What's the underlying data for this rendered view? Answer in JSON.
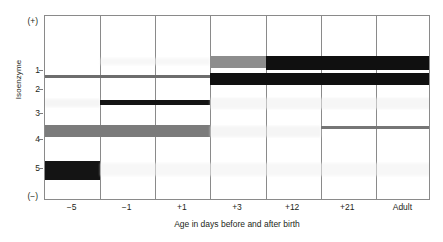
{
  "figure": {
    "axes": {
      "y_title": "Isoenzyme",
      "y_tick_labels": [
        "1",
        "2",
        "3",
        "4",
        "5"
      ],
      "y_polarity_top": "(+)",
      "y_polarity_bottom": "(−)",
      "x_title": "Age in days before and after birth",
      "x_tick_labels": [
        "−5",
        "−1",
        "+1",
        "+3",
        "+12",
        "+21",
        "Adult"
      ]
    },
    "colors": {
      "frame": "#8a8a8a",
      "text": "#231f20",
      "band_black": "#111111",
      "band_dark_gray": "#5f5f5f",
      "band_mid_gray": "#7b7b7b",
      "band_light_gray": "#b5b5b5",
      "band_faint": "#ececec",
      "background": "#ffffff"
    }
  },
  "chart_data": {
    "type": "heatmap",
    "title": "",
    "xlabel": "Age in days before and after birth",
    "ylabel": "Isoenzyme",
    "categories": [
      "−5",
      "−1",
      "+1",
      "+3",
      "+12",
      "+21",
      "Adult"
    ],
    "rows": [
      "1",
      "2",
      "3",
      "4",
      "5"
    ],
    "row_positions_pct": [
      30.0,
      41.5,
      55.0,
      69.5,
      85.5
    ],
    "grid": true,
    "legend": "none",
    "note": "Electrophoretic gel diagram: band darkness = relative isoenzyme abundance per age group",
    "series": [
      {
        "name": "Isoenzyme 1",
        "row": "1",
        "values": [
          0,
          0,
          0,
          2,
          3,
          3,
          3
        ],
        "intensity_labels": [
          "none",
          "none",
          "none",
          "medium",
          "strong",
          "strong",
          "strong"
        ]
      },
      {
        "name": "Isoenzyme 2",
        "row": "2",
        "values": [
          1,
          1,
          1,
          3,
          3,
          3,
          3
        ],
        "intensity_labels": [
          "faint",
          "faint",
          "faint",
          "strong",
          "strong",
          "strong",
          "strong"
        ]
      },
      {
        "name": "Isoenzyme 3",
        "row": "3",
        "values": [
          0,
          3,
          3,
          0,
          0,
          0,
          0
        ],
        "intensity_labels": [
          "none",
          "strong",
          "strong",
          "none",
          "none",
          "none",
          "none"
        ]
      },
      {
        "name": "Isoenzyme 4",
        "row": "4",
        "values": [
          2,
          2,
          2,
          0,
          0,
          1,
          1
        ],
        "intensity_labels": [
          "medium",
          "medium",
          "medium",
          "none",
          "none",
          "faint",
          "faint"
        ]
      },
      {
        "name": "Isoenzyme 5",
        "row": "5",
        "values": [
          3,
          0,
          0,
          0,
          0,
          0,
          0
        ],
        "intensity_labels": [
          "strong",
          "none",
          "none",
          "none",
          "none",
          "none",
          "none"
        ]
      }
    ]
  },
  "bands": [
    {
      "name": "band-iso2-faint-early",
      "row": 2,
      "col_start": 0,
      "col_end": 3,
      "top": 74,
      "height": 3,
      "color": "#6d6d6d",
      "style": "soft"
    },
    {
      "name": "band-iso3-faint-early",
      "row": 3,
      "col_start": 0,
      "col_end": 1,
      "top": 98,
      "height": 8,
      "color": "#ededed",
      "style": "faint"
    },
    {
      "name": "band-iso4-medium-early",
      "row": 4,
      "col_start": 0,
      "col_end": 3,
      "top": 124,
      "height": 12,
      "color": "#7b7b7b",
      "style": "soft"
    },
    {
      "name": "band-iso5-strong-minus5",
      "row": 5,
      "col_start": 0,
      "col_end": 1,
      "top": 160,
      "height": 19,
      "color": "#141414",
      "style": "solid"
    },
    {
      "name": "band-iso5-halo",
      "row": 5,
      "col_start": 1,
      "col_end": 7,
      "top": 162,
      "height": 13,
      "color": "#f1f1f1",
      "style": "faint"
    },
    {
      "name": "band-iso3-strong-mid",
      "row": 3,
      "col_start": 1,
      "col_end": 3,
      "top": 99,
      "height": 5,
      "color": "#141414",
      "style": "solid"
    },
    {
      "name": "band-iso3-halo-late",
      "row": 3,
      "col_start": 3,
      "col_end": 7,
      "top": 97,
      "height": 11,
      "color": "#efefef",
      "style": "faint"
    },
    {
      "name": "band-iso1-halo-early",
      "row": 1,
      "col_start": 1,
      "col_end": 3,
      "top": 57,
      "height": 7,
      "color": "#f2f2f2",
      "style": "faint"
    },
    {
      "name": "band-iso1-medium-plus3",
      "row": 1,
      "col_start": 3,
      "col_end": 4,
      "top": 55,
      "height": 12,
      "color": "#8d8d8d",
      "style": "solid"
    },
    {
      "name": "band-iso1-strong-late",
      "row": 1,
      "col_start": 4,
      "col_end": 7,
      "top": 55,
      "height": 14,
      "color": "#101010",
      "style": "solid"
    },
    {
      "name": "band-iso2-strong-late",
      "row": 2,
      "col_start": 3,
      "col_end": 7,
      "top": 72,
      "height": 12,
      "color": "#101010",
      "style": "solid"
    },
    {
      "name": "band-iso4-halo-late",
      "row": 4,
      "col_start": 3,
      "col_end": 5,
      "top": 125,
      "height": 11,
      "color": "#eeeeee",
      "style": "faint"
    },
    {
      "name": "band-iso4-thin-adult",
      "row": 4,
      "col_start": 5,
      "col_end": 7,
      "top": 125,
      "height": 3,
      "color": "#767676",
      "style": "soft"
    }
  ]
}
